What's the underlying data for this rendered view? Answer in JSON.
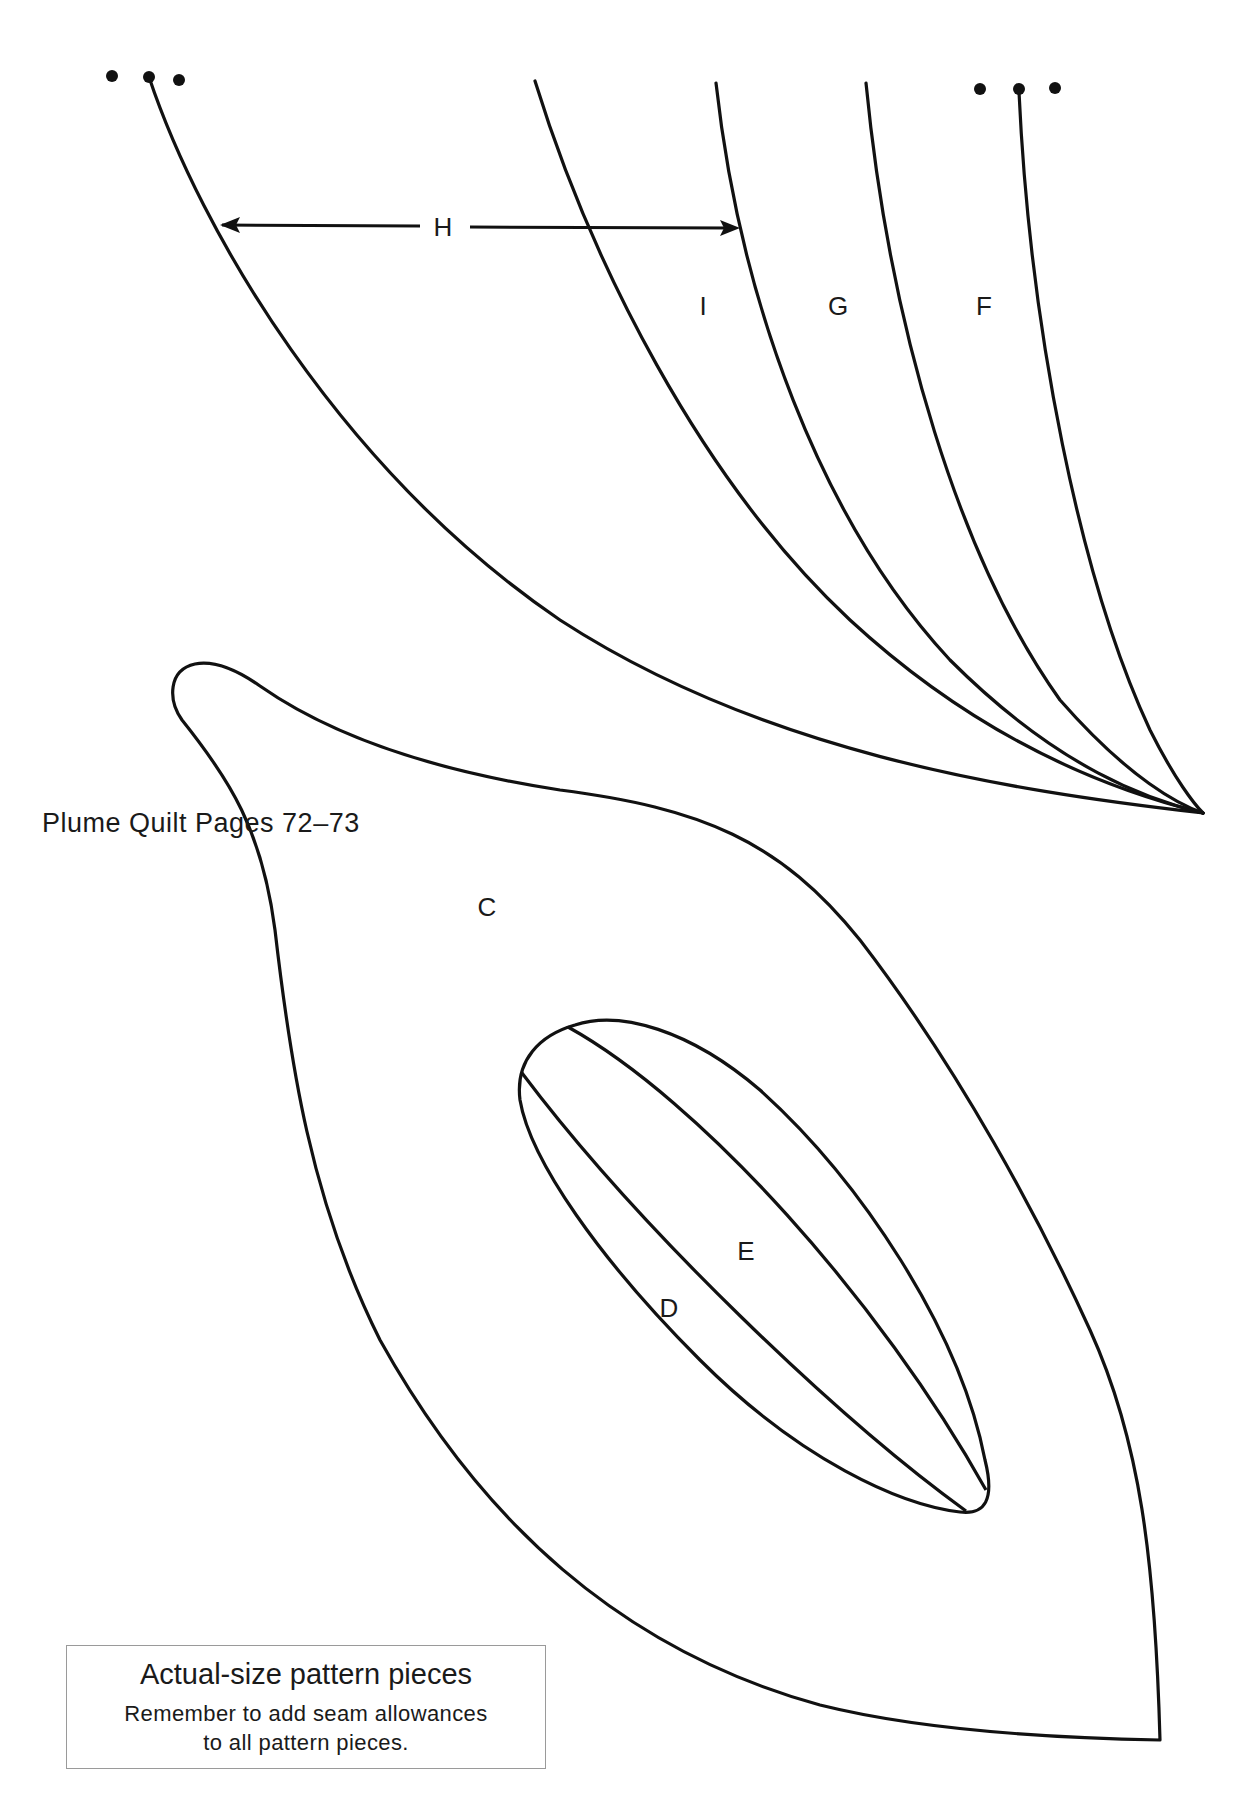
{
  "document": {
    "title": "Plume Quilt Pages 72–73",
    "piece_labels": {
      "H": "H",
      "I": "I",
      "G": "G",
      "F": "F",
      "C": "C",
      "D": "D",
      "E": "E"
    },
    "note": {
      "heading": "Actual-size pattern pieces",
      "line1": "Remember to add seam allowances",
      "line2": "to all pattern pieces."
    }
  }
}
